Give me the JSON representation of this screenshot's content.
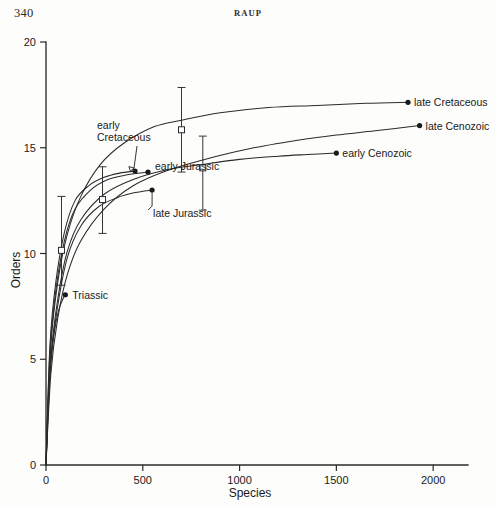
{
  "page": {
    "number": "340",
    "running_head": "RAUP"
  },
  "chart_data": {
    "type": "line",
    "title": "",
    "xlabel": "Species",
    "ylabel": "Orders",
    "xlim": [
      0,
      2180
    ],
    "ylim": [
      0,
      20
    ],
    "xticks": [
      0,
      500,
      1000,
      1500,
      2000
    ],
    "xticklabels": [
      "0",
      "500",
      "1000",
      "1500",
      "2000"
    ],
    "yticks": [
      0,
      5,
      10,
      15,
      20
    ],
    "yticklabels": [
      "0",
      "5",
      "10",
      "15",
      "20"
    ],
    "grid": false,
    "legend": false,
    "series": [
      {
        "name": "late Cretaceous",
        "label": "late Cretaceous",
        "label_x": 1880,
        "label_y": 17.15,
        "endpoint": {
          "x": 1870,
          "y": 17.15
        },
        "marker": "filled-circle",
        "x": [
          0,
          25,
          60,
          110,
          180,
          280,
          400,
          560,
          700,
          900,
          1150,
          1400,
          1650,
          1870
        ],
        "y": [
          0,
          5.6,
          8.6,
          10.9,
          12.7,
          14.2,
          15.2,
          16.0,
          16.3,
          16.65,
          16.9,
          17.0,
          17.1,
          17.15
        ]
      },
      {
        "name": "late Cenozoic",
        "label": "late Cenozoic",
        "label_x": 1940,
        "label_y": 16.05,
        "endpoint": {
          "x": 1930,
          "y": 16.05
        },
        "marker": "filled-circle",
        "x": [
          0,
          25,
          60,
          110,
          180,
          300,
          450,
          620,
          800,
          1050,
          1300,
          1500,
          1700,
          1930
        ],
        "y": [
          0,
          4.3,
          6.9,
          9.0,
          10.6,
          12.1,
          13.2,
          13.9,
          14.4,
          14.95,
          15.35,
          15.6,
          15.8,
          16.05
        ]
      },
      {
        "name": "early Cenozoic",
        "label": "early Cenozoic",
        "label_x": 1510,
        "label_y": 14.75,
        "endpoint": {
          "x": 1500,
          "y": 14.75
        },
        "marker": "filled-circle",
        "x": [
          0,
          25,
          60,
          110,
          180,
          300,
          450,
          620,
          800,
          1000,
          1200,
          1350,
          1500
        ],
        "y": [
          0,
          5.0,
          7.8,
          10.1,
          11.6,
          12.8,
          13.5,
          13.95,
          14.2,
          14.45,
          14.6,
          14.68,
          14.75
        ]
      },
      {
        "name": "early Cretaceous",
        "label": "early Cretaceous",
        "label_lines": [
          "early",
          "Cretaceous"
        ],
        "endpoint": {
          "x": 460,
          "y": 13.9
        },
        "marker": "filled-circle",
        "x": [
          0,
          20,
          50,
          95,
          150,
          220,
          300,
          380,
          460
        ],
        "y": [
          0,
          5.6,
          8.6,
          11.0,
          12.5,
          13.2,
          13.6,
          13.8,
          13.9
        ]
      },
      {
        "name": "early Jurassic",
        "label": "early Jurassic",
        "label_x": 560,
        "label_y": 14.25,
        "endpoint": {
          "x": 527,
          "y": 13.85
        },
        "marker": "filled-circle",
        "x": [
          0,
          20,
          50,
          95,
          150,
          230,
          320,
          420,
          527
        ],
        "y": [
          0,
          5.3,
          8.2,
          10.6,
          12.1,
          13.0,
          13.5,
          13.72,
          13.85
        ]
      },
      {
        "name": "late Jurassic",
        "label": "late Jurassic",
        "endpoint": {
          "x": 548,
          "y": 13.0
        },
        "marker": "filled-circle",
        "x": [
          0,
          20,
          55,
          110,
          180,
          270,
          370,
          460,
          548
        ],
        "y": [
          0,
          4.4,
          7.2,
          9.8,
          11.3,
          12.2,
          12.65,
          12.88,
          13.0
        ]
      },
      {
        "name": "Triassic",
        "label": "Triassic",
        "label_x": 135,
        "label_y": 8.1,
        "endpoint": {
          "x": 100,
          "y": 8.05
        },
        "marker": "filled-circle",
        "x": [
          0,
          10,
          25,
          45,
          65,
          85,
          100
        ],
        "y": [
          0,
          2.8,
          4.8,
          6.4,
          7.3,
          7.8,
          8.05
        ]
      }
    ],
    "error_bars": [
      {
        "x": 80,
        "y": 10.15,
        "low": 8.5,
        "high": 12.7,
        "marker": "open-square"
      },
      {
        "x": 292,
        "y": 12.55,
        "low": 10.95,
        "high": 14.1,
        "marker": "open-square"
      },
      {
        "x": 700,
        "y": 15.85,
        "low": 13.85,
        "high": 17.85,
        "marker": "open-square"
      },
      {
        "x": 810,
        "y": 14.05,
        "low": 12.05,
        "high": 15.55,
        "marker": "open-square"
      }
    ],
    "annotations": [
      {
        "text": "late Cretaceous",
        "x": 1880,
        "y": 17.15
      },
      {
        "text": "late Cenozoic",
        "x": 1940,
        "y": 16.05
      },
      {
        "text": "early Cenozoic",
        "x": 1510,
        "y": 14.75
      },
      {
        "text": "early",
        "x": 250,
        "y": 16.35
      },
      {
        "text": "Cretaceous",
        "x": 250,
        "y": 15.55
      },
      {
        "text": "early Jurassic",
        "x": 565,
        "y": 14.35
      },
      {
        "text": "late  Jurassic",
        "x": 550,
        "y": 12.1
      },
      {
        "text": "Triassic",
        "x": 145,
        "y": 8.15
      }
    ]
  }
}
